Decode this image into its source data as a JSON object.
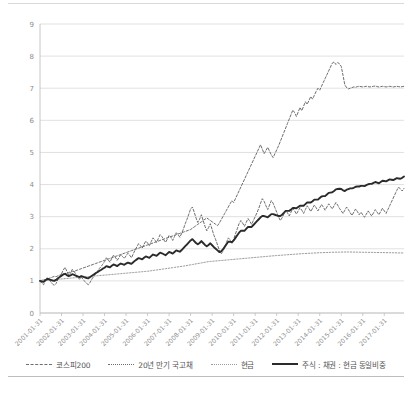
{
  "chart_data": {
    "type": "line",
    "title": "",
    "xlabel": "",
    "ylabel": "",
    "ylim": [
      0,
      9
    ],
    "yticks": [
      0,
      1,
      2,
      3,
      4,
      5,
      6,
      7,
      8,
      9
    ],
    "grid": true,
    "legend_position": "bottom",
    "x_tick_labels": [
      "2001-01-31",
      "2002-01-31",
      "2003-01-31",
      "2004-01-31",
      "2005-01-31",
      "2006-01-31",
      "2007-01-31",
      "2008-01-31",
      "2009-01-31",
      "2010-01-31",
      "2011-01-31",
      "2012-01-31",
      "2013-01-31",
      "2014-01-31",
      "2015-01-31",
      "2016-01-31",
      "2017-01-31"
    ],
    "x_start": "2001-01-31",
    "x_end": "2017-12-31",
    "series": [
      {
        "name": "코스피200",
        "style": "dashed",
        "color": "#6e6e6e",
        "values": [
          1.0,
          0.93,
          0.88,
          1.02,
          1.1,
          1.04,
          0.97,
          0.9,
          0.86,
          0.92,
          1.04,
          1.12,
          1.22,
          1.34,
          1.42,
          1.3,
          1.18,
          1.24,
          1.36,
          1.3,
          1.2,
          1.12,
          1.05,
          1.12,
          1.05,
          0.98,
          0.92,
          0.88,
          0.96,
          1.06,
          1.14,
          1.22,
          1.3,
          1.38,
          1.44,
          1.52,
          1.6,
          1.72,
          1.66,
          1.58,
          1.7,
          1.8,
          1.74,
          1.64,
          1.72,
          1.82,
          1.76,
          1.7,
          1.78,
          1.86,
          1.8,
          1.72,
          1.84,
          1.96,
          2.06,
          2.16,
          2.1,
          2.02,
          2.14,
          2.24,
          2.18,
          2.1,
          2.22,
          2.34,
          2.28,
          2.2,
          2.32,
          2.44,
          2.38,
          2.28,
          2.2,
          2.3,
          2.42,
          2.36,
          2.26,
          2.38,
          2.5,
          2.44,
          2.36,
          2.48,
          2.62,
          2.78,
          2.92,
          3.08,
          3.24,
          3.3,
          3.14,
          2.96,
          2.82,
          2.92,
          3.06,
          2.88,
          2.7,
          2.56,
          2.66,
          2.78,
          2.6,
          2.42,
          2.28,
          2.12,
          1.96,
          1.84,
          1.92,
          2.06,
          2.2,
          2.34,
          2.28,
          2.18,
          2.3,
          2.46,
          2.62,
          2.78,
          2.88,
          2.8,
          2.7,
          2.82,
          2.94,
          2.86,
          2.76,
          2.88,
          3.0,
          3.12,
          3.26,
          3.42,
          3.56,
          3.48,
          3.34,
          3.22,
          3.36,
          3.5,
          3.42,
          3.28,
          3.14,
          3.0,
          2.88,
          2.96,
          3.08,
          3.2,
          3.12,
          3.02,
          3.14,
          3.26,
          3.18,
          3.08,
          3.18,
          3.28,
          3.2,
          3.1,
          3.22,
          3.34,
          3.26,
          3.16,
          3.26,
          3.36,
          3.28,
          3.18,
          3.28,
          3.38,
          3.3,
          3.2,
          3.3,
          3.4,
          3.32,
          3.24,
          3.34,
          3.44,
          3.36,
          3.26,
          3.18,
          3.1,
          3.2,
          3.3,
          3.22,
          3.12,
          3.04,
          3.14,
          3.24,
          3.16,
          3.06,
          3.14,
          3.06,
          2.98,
          3.08,
          3.18,
          3.1,
          3.02,
          3.12,
          3.22,
          3.14,
          3.06,
          3.16,
          3.26,
          3.18,
          3.1,
          3.22,
          3.34,
          3.46,
          3.58,
          3.7,
          3.82,
          3.92,
          3.86,
          3.8,
          3.88
        ]
      },
      {
        "name": "20년 만기 국고채",
        "style": "dashed",
        "color": "#6e6e6e",
        "values": [
          1.0,
          1.02,
          1.04,
          1.03,
          1.06,
          1.08,
          1.1,
          1.12,
          1.14,
          1.13,
          1.16,
          1.18,
          1.2,
          1.22,
          1.21,
          1.24,
          1.26,
          1.28,
          1.3,
          1.29,
          1.32,
          1.34,
          1.36,
          1.38,
          1.4,
          1.42,
          1.44,
          1.46,
          1.48,
          1.5,
          1.52,
          1.54,
          1.56,
          1.58,
          1.6,
          1.62,
          1.64,
          1.66,
          1.68,
          1.7,
          1.72,
          1.74,
          1.76,
          1.78,
          1.8,
          1.82,
          1.84,
          1.86,
          1.88,
          1.9,
          1.92,
          1.94,
          1.96,
          1.98,
          2.0,
          2.02,
          2.04,
          2.06,
          2.08,
          2.1,
          2.12,
          2.14,
          2.16,
          2.18,
          2.2,
          2.22,
          2.24,
          2.26,
          2.28,
          2.3,
          2.32,
          2.34,
          2.36,
          2.38,
          2.4,
          2.42,
          2.44,
          2.46,
          2.48,
          2.5,
          2.52,
          2.54,
          2.56,
          2.58,
          2.6,
          2.64,
          2.68,
          2.72,
          2.76,
          2.8,
          2.84,
          2.88,
          2.92,
          2.96,
          2.92,
          2.88,
          2.84,
          2.8,
          2.76,
          2.72,
          2.8,
          2.9,
          3.0,
          3.1,
          3.2,
          3.3,
          3.4,
          3.5,
          3.44,
          3.56,
          3.68,
          3.8,
          3.92,
          4.04,
          4.16,
          4.28,
          4.4,
          4.52,
          4.64,
          4.76,
          4.88,
          5.0,
          5.12,
          5.24,
          5.1,
          4.96,
          5.06,
          5.16,
          5.04,
          4.92,
          4.84,
          4.96,
          5.08,
          5.2,
          5.34,
          5.48,
          5.62,
          5.76,
          5.9,
          6.04,
          6.18,
          6.32,
          6.24,
          6.12,
          6.26,
          6.4,
          6.3,
          6.44,
          6.58,
          6.5,
          6.62,
          6.74,
          6.66,
          6.78,
          6.9,
          7.0,
          6.94,
          7.06,
          7.18,
          7.3,
          7.42,
          7.54,
          7.66,
          7.78,
          7.82,
          7.74,
          7.8,
          7.76,
          7.68,
          7.4,
          7.1,
          7.02,
          6.98,
          7.0,
          7.02,
          7.04,
          7.03,
          7.05,
          7.06,
          7.05,
          7.04,
          7.05,
          7.06,
          7.05,
          7.04,
          7.05,
          7.06,
          7.07,
          7.05,
          7.04,
          7.05,
          7.06,
          7.05,
          7.04,
          7.05,
          7.06,
          7.05,
          7.04,
          7.05,
          7.06,
          7.05,
          7.04,
          7.05,
          7.06
        ]
      },
      {
        "name": "현금",
        "style": "dotted",
        "color": "#9a9a9a",
        "values": [
          1.0,
          1.005,
          1.01,
          1.015,
          1.02,
          1.025,
          1.03,
          1.035,
          1.04,
          1.045,
          1.05,
          1.055,
          1.06,
          1.065,
          1.07,
          1.075,
          1.08,
          1.085,
          1.09,
          1.095,
          1.1,
          1.105,
          1.11,
          1.115,
          1.12,
          1.125,
          1.13,
          1.135,
          1.14,
          1.145,
          1.15,
          1.155,
          1.16,
          1.165,
          1.17,
          1.175,
          1.18,
          1.185,
          1.19,
          1.195,
          1.2,
          1.205,
          1.21,
          1.215,
          1.22,
          1.225,
          1.23,
          1.235,
          1.24,
          1.245,
          1.25,
          1.255,
          1.26,
          1.265,
          1.27,
          1.275,
          1.28,
          1.285,
          1.29,
          1.295,
          1.3,
          1.308,
          1.316,
          1.324,
          1.332,
          1.34,
          1.348,
          1.356,
          1.364,
          1.372,
          1.38,
          1.388,
          1.396,
          1.404,
          1.412,
          1.42,
          1.428,
          1.436,
          1.444,
          1.452,
          1.46,
          1.47,
          1.48,
          1.49,
          1.5,
          1.51,
          1.52,
          1.53,
          1.54,
          1.55,
          1.56,
          1.57,
          1.58,
          1.59,
          1.6,
          1.605,
          1.61,
          1.615,
          1.62,
          1.625,
          1.63,
          1.635,
          1.64,
          1.645,
          1.65,
          1.655,
          1.66,
          1.665,
          1.67,
          1.675,
          1.68,
          1.685,
          1.69,
          1.695,
          1.7,
          1.705,
          1.71,
          1.715,
          1.72,
          1.725,
          1.73,
          1.735,
          1.74,
          1.745,
          1.75,
          1.755,
          1.76,
          1.765,
          1.77,
          1.775,
          1.78,
          1.785,
          1.79,
          1.794,
          1.798,
          1.802,
          1.806,
          1.81,
          1.814,
          1.818,
          1.822,
          1.826,
          1.83,
          1.834,
          1.838,
          1.842,
          1.846,
          1.85,
          1.853,
          1.856,
          1.859,
          1.862,
          1.865,
          1.868,
          1.871,
          1.874,
          1.877,
          1.879,
          1.881,
          1.883,
          1.885,
          1.887,
          1.889,
          1.891,
          1.893,
          1.894,
          1.895,
          1.896,
          1.897,
          1.898,
          1.899,
          1.9,
          1.9,
          1.899,
          1.898,
          1.897,
          1.896,
          1.895,
          1.894,
          1.893,
          1.892,
          1.891,
          1.89,
          1.889,
          1.888,
          1.887,
          1.886,
          1.885,
          1.884,
          1.883,
          1.882,
          1.881,
          1.88,
          1.879,
          1.878,
          1.877,
          1.876,
          1.875,
          1.874,
          1.873,
          1.872,
          1.871,
          1.87,
          1.869
        ]
      },
      {
        "name": "주식 : 채권 : 현금 동일비중",
        "style": "solid",
        "color": "#2b2b2b",
        "values": [
          1.0,
          0.98,
          0.97,
          1.02,
          1.06,
          1.05,
          1.03,
          1.01,
          1.0,
          1.03,
          1.08,
          1.12,
          1.16,
          1.2,
          1.22,
          1.18,
          1.15,
          1.17,
          1.21,
          1.19,
          1.16,
          1.14,
          1.12,
          1.15,
          1.13,
          1.11,
          1.09,
          1.08,
          1.12,
          1.16,
          1.2,
          1.24,
          1.27,
          1.31,
          1.34,
          1.38,
          1.41,
          1.46,
          1.44,
          1.42,
          1.47,
          1.51,
          1.49,
          1.46,
          1.5,
          1.54,
          1.52,
          1.5,
          1.54,
          1.57,
          1.55,
          1.53,
          1.58,
          1.63,
          1.67,
          1.71,
          1.69,
          1.67,
          1.72,
          1.76,
          1.74,
          1.72,
          1.77,
          1.82,
          1.8,
          1.78,
          1.83,
          1.88,
          1.86,
          1.83,
          1.8,
          1.85,
          1.9,
          1.88,
          1.85,
          1.9,
          1.95,
          1.93,
          1.91,
          1.96,
          2.02,
          2.08,
          2.14,
          2.2,
          2.26,
          2.3,
          2.24,
          2.18,
          2.14,
          2.18,
          2.24,
          2.18,
          2.12,
          2.08,
          2.12,
          2.17,
          2.11,
          2.05,
          2.0,
          1.95,
          1.9,
          1.92,
          1.98,
          2.06,
          2.14,
          2.22,
          2.22,
          2.2,
          2.26,
          2.34,
          2.42,
          2.5,
          2.56,
          2.56,
          2.56,
          2.62,
          2.68,
          2.68,
          2.68,
          2.74,
          2.8,
          2.86,
          2.92,
          2.98,
          3.02,
          3.02,
          3.0,
          2.98,
          3.03,
          3.08,
          3.08,
          3.06,
          3.04,
          3.02,
          3.02,
          3.06,
          3.12,
          3.18,
          3.18,
          3.18,
          3.22,
          3.27,
          3.27,
          3.26,
          3.3,
          3.34,
          3.34,
          3.34,
          3.39,
          3.44,
          3.44,
          3.44,
          3.48,
          3.53,
          3.53,
          3.53,
          3.58,
          3.63,
          3.64,
          3.64,
          3.69,
          3.74,
          3.75,
          3.76,
          3.8,
          3.85,
          3.86,
          3.87,
          3.86,
          3.82,
          3.8,
          3.84,
          3.86,
          3.88,
          3.88,
          3.9,
          3.93,
          3.94,
          3.94,
          3.96,
          3.96,
          3.95,
          3.98,
          4.01,
          4.02,
          4.02,
          4.05,
          4.08,
          4.06,
          4.04,
          4.08,
          4.12,
          4.11,
          4.1,
          4.13,
          4.16,
          4.15,
          4.14,
          4.17,
          4.2,
          4.19,
          4.18,
          4.21,
          4.25
        ]
      }
    ]
  },
  "legend": {
    "items": [
      {
        "label": "코스피200",
        "swatch": "dashed-line-marker"
      },
      {
        "label": "20년 만기 국고채",
        "swatch": "dashed-line-marker"
      },
      {
        "label": "현금",
        "swatch": "dotted-line-marker"
      },
      {
        "label": "주식 : 채권 : 현금 동일비중",
        "swatch": "solid-line-marker"
      }
    ]
  },
  "colors": {
    "grid": "#d9d9d9",
    "axis": "#bfbfbf",
    "text": "#8c8c8c",
    "series_dark": "#2b2b2b",
    "series_gray": "#6e6e6e",
    "series_light": "#9a9a9a"
  }
}
